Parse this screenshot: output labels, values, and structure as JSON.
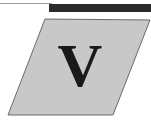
{
  "emblem": {
    "letter": "V",
    "fill_color": "#c8c8c8",
    "bar_color": "#2a2a2a"
  }
}
